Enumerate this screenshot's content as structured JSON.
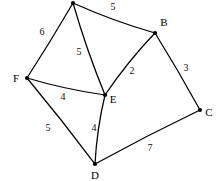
{
  "diagram": {
    "stroke_color": "#000000",
    "background_color": "#ffffff",
    "vertices": [
      {
        "id": "A",
        "label": "",
        "x": 73,
        "y": 3,
        "label_x": 73,
        "label_y": -8
      },
      {
        "id": "B",
        "label": "B",
        "x": 155,
        "y": 33,
        "label_x": 164,
        "label_y": 22
      },
      {
        "id": "C",
        "label": "C",
        "x": 200,
        "y": 110,
        "label_x": 209,
        "label_y": 112
      },
      {
        "id": "D",
        "label": "D",
        "x": 95,
        "y": 164,
        "label_x": 95,
        "label_y": 175
      },
      {
        "id": "E",
        "label": "E",
        "x": 105,
        "y": 95,
        "label_x": 113,
        "label_y": 99
      },
      {
        "id": "F",
        "label": "F",
        "x": 27,
        "y": 78,
        "label_x": 16,
        "label_y": 78
      }
    ],
    "edges": [
      {
        "from": "A",
        "to": "B",
        "weight": "5",
        "label_x": 113,
        "label_y": 7
      },
      {
        "from": "A",
        "to": "F",
        "weight": "6",
        "label_x": 42,
        "label_y": 32
      },
      {
        "from": "A",
        "to": "E",
        "weight": "5",
        "label_x": 79,
        "label_y": 52
      },
      {
        "from": "B",
        "to": "E",
        "weight": "2",
        "label_x": 132,
        "label_y": 71
      },
      {
        "from": "B",
        "to": "C",
        "weight": "3",
        "label_x": 186,
        "label_y": 68
      },
      {
        "from": "F",
        "to": "E",
        "weight": "4",
        "label_x": 63,
        "label_y": 97
      },
      {
        "from": "E",
        "to": "D",
        "weight": "4",
        "label_x": 94,
        "label_y": 128
      },
      {
        "from": "F",
        "to": "D",
        "weight": "5",
        "label_x": 48,
        "label_y": 128
      },
      {
        "from": "D",
        "to": "C",
        "weight": "7",
        "label_x": 150,
        "label_y": 148
      }
    ]
  }
}
